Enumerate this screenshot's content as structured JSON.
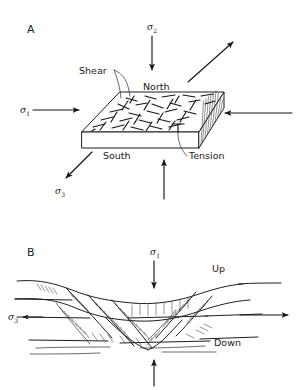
{
  "figure": {
    "panels": [
      {
        "id": "A",
        "label": "A",
        "type": "block-diagram",
        "description": "Three-dimensional block with shear and tension fractures under triaxial stress",
        "annotations": {
          "shear_label": "Shear",
          "tension_label": "Tension",
          "north_label": "North",
          "south_label": "South"
        },
        "stresses": [
          {
            "name": "sigma_1",
            "symbol": "σ",
            "subscript": "1",
            "direction": "right",
            "position": "left"
          },
          {
            "name": "sigma_2",
            "symbol": "σ",
            "subscript": "2",
            "direction": "down",
            "position": "top"
          },
          {
            "name": "sigma_3",
            "symbol": "σ",
            "subscript": "3",
            "direction": "down-left",
            "position": "bottom-left"
          }
        ],
        "arrows": [
          {
            "name": "sigma1-arrow",
            "direction": "right"
          },
          {
            "name": "sigma2-arrow",
            "direction": "down"
          },
          {
            "name": "sigma3-arrow",
            "direction": "down-left"
          },
          {
            "name": "extension-arrow-upper-right",
            "direction": "up-right"
          },
          {
            "name": "compression-arrow-right",
            "direction": "left"
          },
          {
            "name": "compression-arrow-bottom",
            "direction": "up"
          }
        ]
      },
      {
        "id": "B",
        "label": "B",
        "type": "cross-section",
        "description": "Cross-section of a graben bounded by normal faults showing up and down blocks",
        "annotations": {
          "up_label": "Up",
          "down_label": "Down"
        },
        "stresses": [
          {
            "name": "sigma_1",
            "symbol": "σ",
            "subscript": "1",
            "direction": "down",
            "position": "top-center"
          },
          {
            "name": "sigma_3",
            "symbol": "σ",
            "subscript": "3",
            "direction": "left",
            "position": "left"
          }
        ],
        "arrows": [
          {
            "name": "sigma1-arrow",
            "direction": "down"
          },
          {
            "name": "sigma3-arrow",
            "direction": "left"
          },
          {
            "name": "extension-arrow-right",
            "direction": "right"
          },
          {
            "name": "compression-arrow-bottom",
            "direction": "up"
          }
        ]
      }
    ],
    "colors": {
      "ink": "#1a1a1a",
      "background": "#ffffff"
    }
  }
}
